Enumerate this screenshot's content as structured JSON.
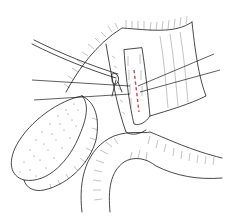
{
  "figure": {
    "type": "surgical-illustration",
    "colors": {
      "line": "#1a1a1a",
      "hatch": "#555555",
      "incision": "#d9404a",
      "background": "#ffffff"
    },
    "elements": [
      {
        "name": "gallbladder",
        "description": "pear-shaped stippled organ at lower left"
      },
      {
        "name": "cystic-duct-clamp",
        "description": "instrument/tube entering from upper left"
      },
      {
        "name": "common-bile-duct",
        "description": "vertical exposed duct segment at center"
      },
      {
        "name": "incision-line",
        "description": "red dashed vertical line on common bile duct"
      },
      {
        "name": "stay-sutures",
        "description": "four long suture threads crossing the duct"
      },
      {
        "name": "duodenum",
        "description": "curved hatched bowel loop at bottom"
      },
      {
        "name": "liver-edge",
        "description": "hatched tissue edge along top"
      }
    ]
  }
}
